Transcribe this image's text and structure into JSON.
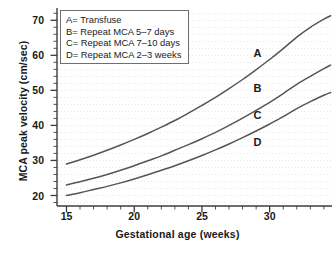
{
  "chart_data": {
    "type": "line",
    "title": "",
    "xlabel": "Gestational age (weeks)",
    "ylabel": "MCA peak velocity (cm/sec)",
    "xlim": [
      14.3,
      34.6
    ],
    "ylim": [
      17.0,
      73.5
    ],
    "xticks": [
      15,
      20,
      25,
      30
    ],
    "xtick_labels": [
      "15",
      "20",
      "25",
      "30"
    ],
    "yticks": [
      20,
      30,
      40,
      50,
      60,
      70
    ],
    "ytick_labels": [
      "20",
      "30",
      "40",
      "50",
      "60",
      "70"
    ],
    "x_minor_tick_step": 1,
    "y_minor_tick_step": 2,
    "grid": "faint horizontal dotted",
    "legend_position": "upper-left inside plot",
    "line_color": "#555555",
    "axis_color": "#3d3d3d",
    "grid_color": "#dedede",
    "background": "#ffffff",
    "series": [
      {
        "name": "A",
        "label": "A= Transfuse",
        "annotation": "A",
        "annotation_at": [
          29.1,
          60.5
        ],
        "x": [
          15,
          16,
          17,
          18,
          19,
          20,
          21,
          22,
          23,
          24,
          25,
          26,
          27,
          28,
          29,
          30,
          31,
          32,
          33,
          34,
          34.5
        ],
        "y": [
          29.0,
          30.2,
          31.5,
          32.9,
          34.4,
          36.0,
          37.7,
          39.5,
          41.4,
          43.5,
          45.7,
          48.0,
          50.5,
          53.1,
          55.9,
          58.8,
          61.9,
          65.2,
          68.0,
          70.3,
          71.3
        ]
      },
      {
        "name": "B",
        "label": "B= Repeat MCA 5–7 days",
        "annotation": "B",
        "annotation_at": [
          29.1,
          50.3
        ],
        "x": [
          15,
          16,
          17,
          18,
          19,
          20,
          21,
          22,
          23,
          24,
          25,
          26,
          27,
          28,
          29,
          30,
          31,
          32,
          33,
          34,
          34.5
        ],
        "y": [
          23.0,
          23.9,
          24.9,
          26.0,
          27.2,
          28.5,
          29.9,
          31.3,
          32.9,
          34.5,
          36.2,
          38.0,
          40.0,
          42.1,
          44.3,
          46.6,
          49.1,
          51.7,
          54.0,
          56.2,
          57.2
        ]
      },
      {
        "name": "C",
        "label": "C= Repeat MCA 7–10 days",
        "annotation": "C",
        "annotation_at": [
          29.1,
          42.8
        ],
        "x": [
          15,
          16,
          17,
          18,
          19,
          20,
          21,
          22,
          23,
          24,
          25,
          26,
          27,
          28,
          29,
          30,
          31,
          32,
          33,
          34,
          34.5
        ],
        "y": [
          20.0,
          20.8,
          21.7,
          22.6,
          23.6,
          24.7,
          25.9,
          27.2,
          28.5,
          29.9,
          31.4,
          33.0,
          34.7,
          36.5,
          38.4,
          40.4,
          42.5,
          44.8,
          46.8,
          48.6,
          49.4
        ]
      },
      {
        "name": "D",
        "label": "D= Repeat MCA 2–3 weeks",
        "annotation": "D",
        "annotation_at": [
          29.1,
          35.0
        ]
      }
    ]
  },
  "legend": {
    "items": [
      "A= Transfuse",
      "B= Repeat MCA 5–7 days",
      "C= Repeat MCA 7–10 days",
      "D= Repeat MCA 2–3 weeks"
    ]
  },
  "axes": {
    "x_title": "Gestational age (weeks)",
    "y_title": "MCA peak velocity (cm/sec)",
    "x_tick_labels": [
      "15",
      "20",
      "25",
      "30"
    ],
    "y_tick_labels": [
      "20",
      "30",
      "40",
      "50",
      "60",
      "70"
    ]
  },
  "annotations": {
    "a": "A",
    "b": "B",
    "c": "C",
    "d": "D"
  },
  "caption": ""
}
